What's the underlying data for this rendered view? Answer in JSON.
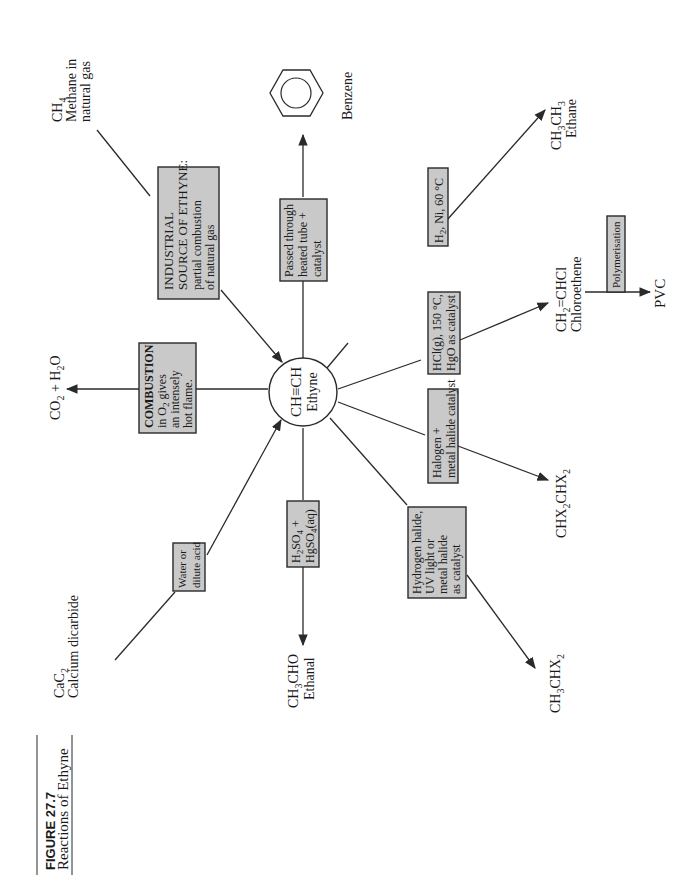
{
  "figure": {
    "number": "FIGURE 27.7",
    "caption": "Reactions of Ethyne"
  },
  "center": {
    "formula": "CH≡CH",
    "name": "Ethyne"
  },
  "colors": {
    "box_fill": "#c9c9c9",
    "line": "#2a2a2a",
    "background": "#ffffff"
  },
  "compounds": {
    "methane": {
      "formula": "CH",
      "sub": "4",
      "name1": "Methane in",
      "name2": "natural gas"
    },
    "benzene": {
      "name": "Benzene"
    },
    "ethane": {
      "formula_a": "CH",
      "sub_a": "3",
      "formula_b": "CH",
      "sub_b": "3",
      "name": "Ethane"
    },
    "chloroethene": {
      "formula_a": "CH",
      "sub_a": "2",
      "formula_b": "=CHCl",
      "name": "Chloroethene"
    },
    "pvc": {
      "name": "PVC"
    },
    "chx2chx2": {
      "formula_a": "CHX",
      "sub_a": "2",
      "formula_b": "CHX",
      "sub_b": "2"
    },
    "ch3chx2": {
      "formula_a": "CH",
      "sub_a": "3",
      "formula_b": "CHX",
      "sub_b": "2"
    },
    "ethanal": {
      "formula_a": "CH",
      "sub_a": "3",
      "formula_b": "CHO",
      "name": "Ethanal"
    },
    "calcium_dicarbide": {
      "formula": "CaC",
      "sub": "2",
      "name": "Calcium dicarbide"
    },
    "co2_h2o": {
      "a": "CO",
      "sub_a": "2",
      "b": " + H",
      "sub_b": "2",
      "c": "O"
    }
  },
  "conditions": {
    "industrial": {
      "line1": "INDUSTRIAL",
      "line2": "SOURCE OF ETHYNE:",
      "line3": "partial combustion",
      "line4": "of natural gas"
    },
    "heated_tube": {
      "line1": "Passed through",
      "line2": "heated tube +",
      "line3": "catalyst"
    },
    "hydrogenation": {
      "a": "H",
      "sub": "2",
      "b": ", Ni, 60 °C"
    },
    "hcl": {
      "line1": "HCl(g), 150 °C,",
      "line2": "HgO as catalyst"
    },
    "polymerisation": {
      "label": "Polymerisation"
    },
    "halogen": {
      "line1": "Halogen +",
      "line2": "metal halide catalyst"
    },
    "hydrogen_halide": {
      "line1": "Hydrogen halide,",
      "line2": "UV light or",
      "line3": "metal halide",
      "line4": "as catalyst"
    },
    "hydration": {
      "l1a": "H",
      "l1sub": "2",
      "l1b": "SO",
      "l1sub2": "4",
      "l1c": " +",
      "l2a": "HgSO",
      "l2sub": "4",
      "l2b": "(aq)"
    },
    "water": {
      "line1": "Water or",
      "line2": "dilute acid"
    },
    "combustion": {
      "line1": "COMBUSTION",
      "l2a": "in O",
      "l2sub": "2",
      "l2b": " gives",
      "line3": "an intensely",
      "line4": "hot flame."
    }
  }
}
